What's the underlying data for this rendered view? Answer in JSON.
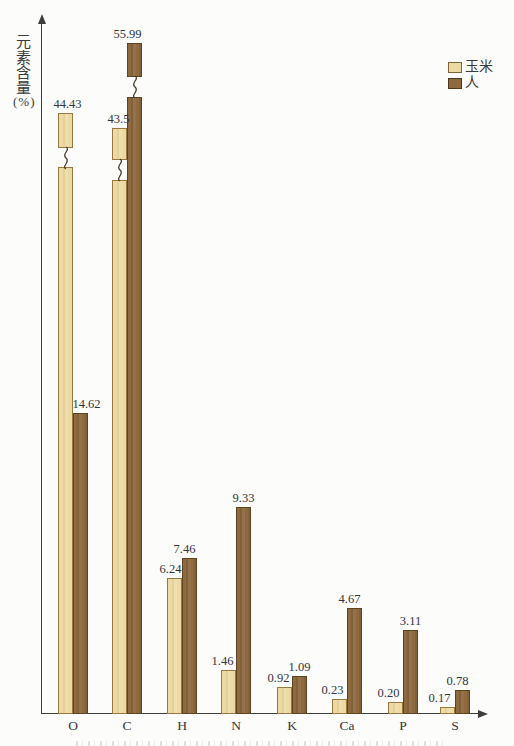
{
  "figure": {
    "background_color": "#fcfcfa",
    "axis_color": "#3e3e3e",
    "y_axis_title_lines": [
      "元",
      "素",
      "含",
      "量",
      "(%)"
    ],
    "legend": {
      "position": "top-right",
      "items": [
        {
          "label": "玉米",
          "color": "#ecd9a3"
        },
        {
          "label": "人",
          "color": "#8e6a40"
        }
      ]
    }
  },
  "chart_data": {
    "type": "bar",
    "title": "",
    "xlabel": "",
    "ylabel": "元素含量(%)",
    "categories": [
      "O",
      "C",
      "H",
      "N",
      "K",
      "Ca",
      "P",
      "S"
    ],
    "series": [
      {
        "name": "玉米",
        "key": "corn",
        "color": "#ecd9a3",
        "values": [
          44.43,
          43.5,
          6.24,
          1.46,
          0.92,
          0.23,
          0.2,
          0.17
        ],
        "value_labels": [
          "44.43",
          "43.5",
          "6.24",
          "1.46",
          "0.92",
          "0.23",
          "0.20",
          "0.17"
        ]
      },
      {
        "name": "人",
        "key": "human",
        "color": "#8e6a40",
        "values": [
          14.62,
          55.99,
          7.46,
          9.33,
          1.09,
          4.67,
          3.11,
          0.78
        ],
        "value_labels": [
          "14.62",
          "55.99",
          "7.46",
          "9.33",
          "1.09",
          "4.67",
          "3.11",
          "0.78"
        ]
      }
    ],
    "axis_breaks": [
      {
        "series": "玉米",
        "category": "O"
      },
      {
        "series": "玉米",
        "category": "C"
      },
      {
        "series": "人",
        "category": "C"
      }
    ],
    "grid": false,
    "legend_position": "top-right"
  }
}
